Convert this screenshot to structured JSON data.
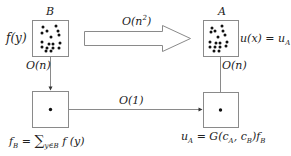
{
  "diagram": {
    "top_left_box": {
      "name": "B",
      "side_label": "f(y)"
    },
    "top_right_box": {
      "name": "A",
      "side_label": "u(x) = u",
      "side_label_sub": "A"
    },
    "big_arrow": {
      "label": "O(n",
      "label_sup": "2",
      "label_end": ")"
    },
    "left_vertical": {
      "label": "O(n)"
    },
    "right_vertical": {
      "label": "O(n)"
    },
    "bottom_arrow": {
      "label": "O(1)"
    },
    "bottom_left_formula": {
      "lhs": "f",
      "lhs_sub": "B",
      "eq": " = ",
      "sum": "∑",
      "sum_sub": "y∈B",
      "rhs": " f (y)"
    },
    "bottom_right_formula": {
      "lhs": "u",
      "lhs_sub": "A",
      "eq": " = G(c",
      "c1_sub": "A",
      "mid": ", c",
      "c2_sub": "B",
      "end": ")f",
      "f_sub": "B"
    },
    "colors": {
      "stroke": "#8a8a8a",
      "dot": "#111111",
      "text": "#222222"
    }
  }
}
